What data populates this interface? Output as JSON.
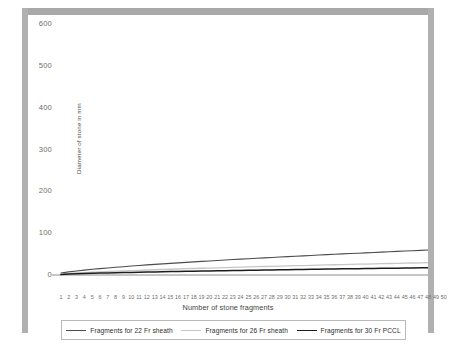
{
  "chart_data": {
    "type": "line",
    "title": "",
    "xlabel": "Number of stone fragments",
    "ylabel": "Diameter of stone in mm",
    "xlim": [
      1,
      50
    ],
    "ylim": [
      0,
      600
    ],
    "grid": false,
    "legend_position": "bottom",
    "x_ticks": [
      1,
      2,
      3,
      4,
      5,
      6,
      7,
      8,
      9,
      10,
      11,
      12,
      13,
      14,
      15,
      16,
      17,
      18,
      19,
      20,
      21,
      22,
      23,
      24,
      25,
      26,
      27,
      28,
      29,
      30,
      31,
      32,
      33,
      34,
      35,
      36,
      37,
      38,
      39,
      40,
      41,
      42,
      43,
      44,
      45,
      46,
      47,
      48,
      49,
      50
    ],
    "y_ticks": [
      0,
      100,
      200,
      300,
      400,
      500,
      600
    ],
    "x": [
      1,
      2,
      3,
      4,
      5,
      6,
      7,
      8,
      9,
      10,
      11,
      12,
      13,
      14,
      15,
      16,
      17,
      18,
      19,
      20,
      21,
      22,
      23,
      24,
      25,
      26,
      27,
      28,
      29,
      30,
      31,
      32,
      33,
      34,
      35,
      36,
      37,
      38,
      39,
      40,
      41,
      42,
      43,
      44,
      45,
      46,
      47,
      48,
      49,
      50
    ],
    "series": [
      {
        "name": "Fragments for 22 Fr sheath",
        "color": "#4c4c4c",
        "width": 1.1,
        "values": [
          4.7,
          7.4,
          9.7,
          11.7,
          13.6,
          15.3,
          16.9,
          18.5,
          19.9,
          21.4,
          22.7,
          24.1,
          25.4,
          26.6,
          27.9,
          29.1,
          30.2,
          31.4,
          32.5,
          33.6,
          34.7,
          35.8,
          36.9,
          37.9,
          38.9,
          40.0,
          41.0,
          42.0,
          42.9,
          43.9,
          44.9,
          45.8,
          46.7,
          47.7,
          48.6,
          49.5,
          50.4,
          51.3,
          52.1,
          53.0,
          53.9,
          54.7,
          55.6,
          56.4,
          57.2,
          58.0,
          58.9,
          59.7,
          60.5,
          61.2
        ]
      },
      {
        "name": "Fragments for 26 Fr sheath",
        "color": "#c6c6c6",
        "width": 1.3,
        "values": [
          2.3,
          3.7,
          4.8,
          5.8,
          6.7,
          7.6,
          8.4,
          9.1,
          9.9,
          10.6,
          11.2,
          11.9,
          12.5,
          13.2,
          13.8,
          14.4,
          15.0,
          15.5,
          16.1,
          16.6,
          17.2,
          17.7,
          18.2,
          18.8,
          19.3,
          19.8,
          20.3,
          20.7,
          21.2,
          21.7,
          22.2,
          22.6,
          23.1,
          23.6,
          24.0,
          24.5,
          24.9,
          25.3,
          25.8,
          26.2,
          26.6,
          27.1,
          27.5,
          27.9,
          28.3,
          28.7,
          29.1,
          29.5,
          29.9,
          30.3
        ]
      },
      {
        "name": "Fragments for 30 Fr PCCL",
        "color": "#1c1c1c",
        "width": 1.5,
        "values": [
          1.4,
          2.2,
          2.9,
          3.4,
          4.0,
          4.5,
          4.9,
          5.4,
          5.8,
          6.2,
          6.6,
          7.0,
          7.4,
          7.7,
          8.1,
          8.4,
          8.8,
          9.1,
          9.4,
          9.8,
          10.1,
          10.4,
          10.7,
          11.0,
          11.3,
          11.6,
          11.9,
          12.2,
          12.5,
          12.8,
          13.0,
          13.3,
          13.6,
          13.9,
          14.1,
          14.4,
          14.7,
          14.9,
          15.2,
          15.4,
          15.7,
          15.9,
          16.2,
          16.4,
          16.7,
          16.9,
          17.1,
          17.4,
          17.6,
          17.8
        ]
      }
    ]
  },
  "legend": {
    "items": [
      {
        "label": "Fragments for 22 Fr sheath",
        "color": "#4c4c4c",
        "width": 1.1
      },
      {
        "label": "Fragments for 26 Fr sheath",
        "color": "#c6c6c6",
        "width": 1.5
      },
      {
        "label": "Fragments for 30 Fr PCCL",
        "color": "#1c1c1c",
        "width": 1.9
      }
    ]
  }
}
